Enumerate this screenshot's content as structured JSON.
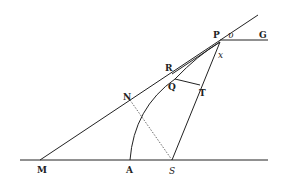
{
  "diagram": {
    "type": "geometric-figure",
    "colors": {
      "ink": "#222222",
      "background": "#ffffff"
    },
    "points": {
      "M": {
        "label": "M",
        "x": 40,
        "y": 160
      },
      "A": {
        "label": "A",
        "x": 130,
        "y": 160
      },
      "S": {
        "label": "S",
        "x": 172,
        "y": 160
      },
      "N": {
        "label": "N",
        "x": 130,
        "y": 100
      },
      "R": {
        "label": "R",
        "x": 173,
        "y": 72
      },
      "Q": {
        "label": "Q",
        "x": 177,
        "y": 80
      },
      "T": {
        "label": "T",
        "x": 199,
        "y": 86
      },
      "P": {
        "label": "P",
        "x": 220,
        "y": 40
      },
      "v": {
        "label": "υ",
        "x": 230,
        "y": 40
      },
      "x": {
        "label": "x",
        "x": 218,
        "y": 52
      },
      "G": {
        "label": "G",
        "x": 262,
        "y": 40
      }
    },
    "lines": [
      {
        "name": "baseline-MS",
        "from": [
          20,
          160
        ],
        "to": [
          268,
          160
        ],
        "style": "solid"
      },
      {
        "name": "tangent-MP",
        "from": [
          40,
          160
        ],
        "to": [
          258,
          15
        ],
        "style": "solid"
      },
      {
        "name": "line-SP",
        "from": [
          172,
          160
        ],
        "to": [
          220,
          42
        ],
        "style": "solid"
      },
      {
        "name": "line-PG",
        "from": [
          220,
          40
        ],
        "to": [
          268,
          40
        ],
        "style": "solid"
      },
      {
        "name": "line-RP",
        "from": [
          172,
          74
        ],
        "to": [
          220,
          42
        ],
        "style": "solid"
      },
      {
        "name": "line-QT",
        "from": [
          175,
          79
        ],
        "to": [
          200,
          85
        ],
        "style": "solid"
      },
      {
        "name": "line-NS",
        "from": [
          130,
          100
        ],
        "to": [
          172,
          160
        ],
        "style": "dotted"
      }
    ],
    "arcs": [
      {
        "name": "curve-AQP",
        "path": "M130,160 Q134,108 175,79 Q198,55 220,42"
      }
    ]
  }
}
